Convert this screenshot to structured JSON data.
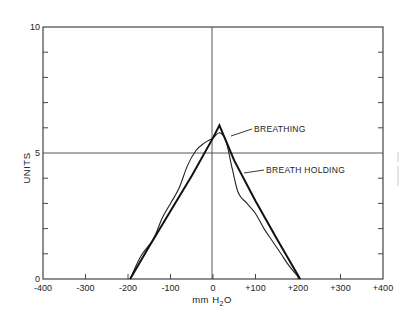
{
  "chart_data": {
    "type": "line",
    "title": "",
    "xlabel": "mm H2O",
    "xlabel_main": "mm H",
    "xlabel_sub": "2",
    "xlabel_end": "O",
    "ylabel": "UNITS",
    "xlim": [
      -400,
      400
    ],
    "ylim": [
      0,
      10
    ],
    "x_ticks": [
      -400,
      -300,
      -200,
      -100,
      0,
      100,
      200,
      300,
      400
    ],
    "x_tick_labels": [
      "-400",
      "-300",
      "-200",
      "-100",
      "0",
      "+100",
      "+200",
      "+300",
      "+400"
    ],
    "y_tick_labels": [
      {
        "value": 0,
        "label": "0"
      },
      {
        "value": 5,
        "label": "5"
      },
      {
        "value": 10,
        "label": "10"
      }
    ],
    "y_minor_ticks": [
      1,
      2,
      3,
      4,
      6,
      7,
      8,
      9
    ],
    "reference_lines": {
      "x": 0,
      "y": 5
    },
    "grid": false,
    "legend_position": "inline annotations",
    "series": [
      {
        "name": "BREATHING",
        "style": "straight, heavy",
        "x": [
          -195,
          -150,
          -100,
          -50,
          0,
          15,
          50,
          100,
          150,
          205
        ],
        "y": [
          0.0,
          1.3,
          2.7,
          4.1,
          5.6,
          6.1,
          4.7,
          3.1,
          1.6,
          0.0
        ]
      },
      {
        "name": "BREATH HOLDING",
        "style": "wavy, thin",
        "x": [
          -195,
          -170,
          -140,
          -120,
          -100,
          -80,
          -60,
          -40,
          -20,
          0,
          15,
          30,
          45,
          60,
          80,
          100,
          120,
          140,
          160,
          180,
          205
        ],
        "y": [
          0.0,
          0.9,
          1.6,
          2.4,
          3.0,
          3.6,
          4.5,
          5.1,
          5.4,
          5.6,
          5.8,
          5.5,
          4.4,
          3.4,
          3.0,
          2.6,
          2.0,
          1.5,
          1.0,
          0.5,
          0.0
        ]
      }
    ],
    "annotations": [
      {
        "text": "BREATHING",
        "points_to": "BREATHING"
      },
      {
        "text": "BREATH HOLDING",
        "points_to": "BREATH HOLDING"
      }
    ]
  }
}
